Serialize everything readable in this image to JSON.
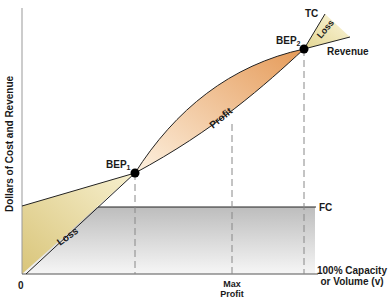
{
  "diagram": {
    "y_axis_label": "Dollars of Cost and Revenue",
    "origin_label": "0",
    "x_axis_label_line1": "100% Capacity",
    "x_axis_label_line2": "or Volume (v)",
    "max_profit_line1": "Max",
    "max_profit_line2": "Profit",
    "fc_label": "FC",
    "tc_label": "TC",
    "revenue_label": "Revenue",
    "bep1_label": "BEP",
    "bep1_sub": "1",
    "bep2_label": "BEP",
    "bep2_sub": "2",
    "loss_label_left": "Loss",
    "loss_label_right": "Loss",
    "profit_label": "Profit",
    "colors": {
      "loss_fill": "#e8dca0",
      "profit_fill_light": "#fbe9d2",
      "profit_fill_dark": "#e9a86a",
      "fc_band_dark": "#bdbdbd",
      "fc_band_light": "#f4f4f4",
      "line": "#222222",
      "dashed": "#888888",
      "point": "#000000"
    }
  }
}
